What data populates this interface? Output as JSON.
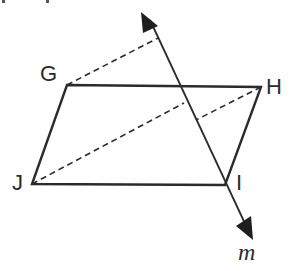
{
  "diagram": {
    "type": "geometry-reflection",
    "colors": {
      "stroke": "#2b2b2b",
      "background": "#ffffff"
    },
    "vertices": [
      {
        "name": "G",
        "x": 67,
        "y": 85
      },
      {
        "name": "H",
        "x": 261,
        "y": 87
      },
      {
        "name": "I",
        "x": 225,
        "y": 185
      },
      {
        "name": "J",
        "x": 32,
        "y": 184
      }
    ],
    "labels": {
      "G": "G",
      "H": "H",
      "I": "I",
      "J": "J",
      "m": "m"
    },
    "line_m": {
      "name": "m",
      "x1": 148,
      "y1": 14,
      "x2": 252,
      "y2": 238,
      "arrows": "both"
    },
    "dashed_segments": [
      {
        "from": "G",
        "to_on_m": {
          "x": 158,
          "y": 38
        }
      },
      {
        "from": "J",
        "to_on_m": {
          "x": 184,
          "y": 103
        }
      },
      {
        "from": "H",
        "to_on_m": {
          "x": 196,
          "y": 120
        }
      }
    ]
  }
}
